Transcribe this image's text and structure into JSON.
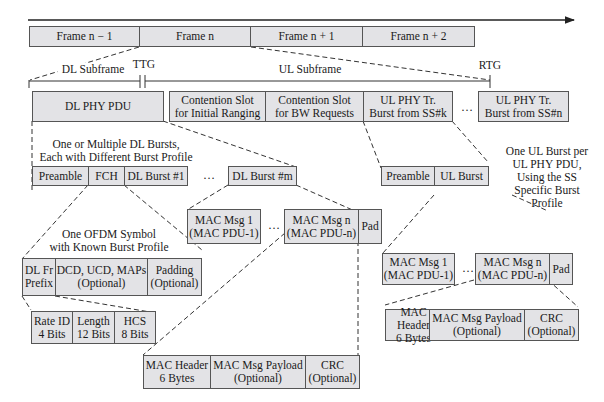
{
  "frames": [
    "Frame n − 1",
    "Frame n",
    "Frame n + 1",
    "Frame n + 2"
  ],
  "timing": {
    "dl_subframe": "DL Subframe",
    "ul_subframe": "UL Subframe",
    "ttg": "TTG",
    "rtg": "RTG"
  },
  "subframe_row": {
    "dl_phy_pdu": "DL PHY PDU",
    "contention_initial": "Contention Slot\nfor Initial Ranging",
    "contention_bw": "Contention Slot\nfor BW Requests",
    "ul_burst_k": "UL PHY Tr.\nBurst from SS#k",
    "ellipsis": "…",
    "ul_burst_n": "UL PHY Tr.\nBurst from SS#n"
  },
  "dl": {
    "annotation": "One or Multiple DL Bursts,\nEach with Different Burst Profile",
    "preamble": "Preamble",
    "fch": "FCH",
    "burst1": "DL Burst #1",
    "ellipsis": "…",
    "burstm": "DL Burst #m",
    "ofdm_annotation": "One OFDM Symbol\nwith Known Burst Profile",
    "fch_fields": [
      "DL Fr\nPrefix",
      "DCD, UCD, MAPs\n(Optional)",
      "Padding\n(Optional)"
    ],
    "prefix_fields": [
      "Rate ID\n4 Bits",
      "Length\n12 Bits",
      "HCS\n8 Bits"
    ],
    "mac_msgs": [
      "MAC Msg 1\n(MAC PDU-1)",
      "…",
      "MAC Msg n\n(MAC PDU-n)",
      "Pad"
    ],
    "mac_pdu": [
      "MAC Header\n6 Bytes",
      "MAC Msg Payload\n(Optional)",
      "CRC\n(Optional)"
    ]
  },
  "ul": {
    "annotation": "One UL Burst per\nUL PHY PDU,\nUsing the SS\nSpecific Burst\nProfile",
    "preamble": "Preamble",
    "burst": "UL Burst",
    "mac_msgs": [
      "MAC Msg 1\n(MAC PDU-1)",
      "…",
      "MAC Msg n\n(MAC PDU-n)",
      "Pad"
    ],
    "mac_pdu": [
      "MAC Header\n6 Bytes",
      "MAC Msg Payload\n(Optional)",
      "CRC\n(Optional)"
    ]
  }
}
